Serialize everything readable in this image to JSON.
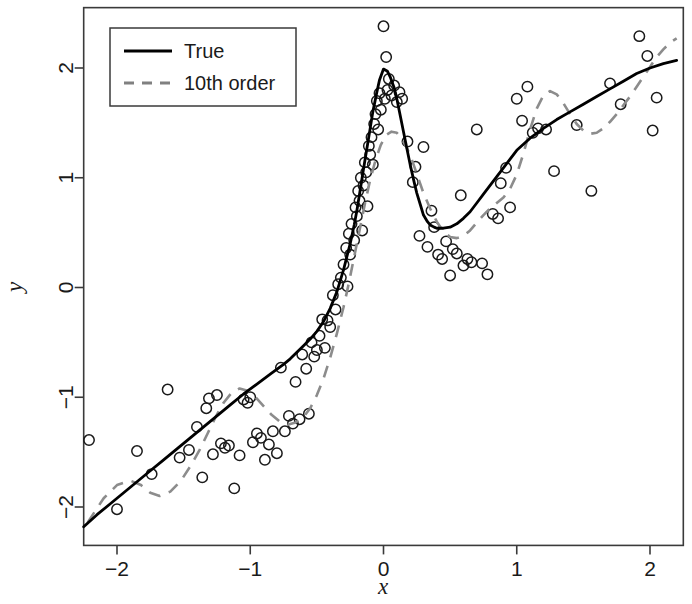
{
  "chart_data": {
    "type": "scatter",
    "title": "",
    "xlabel": "x",
    "ylabel": "y",
    "xlim": [
      -2.25,
      2.25
    ],
    "ylim": [
      -2.35,
      2.55
    ],
    "xticks": [
      -2,
      -1,
      0,
      1,
      2
    ],
    "xtick_labels": [
      "-2",
      "-1",
      "0",
      "1",
      "2"
    ],
    "yticks": [
      -2,
      -1,
      0,
      1,
      2
    ],
    "ytick_labels": [
      "-2",
      "-1",
      "0",
      "1",
      "2"
    ],
    "grid": false,
    "legend_position": "top-left",
    "legend": [
      {
        "label": "True",
        "style": "solid",
        "color": "#000000"
      },
      {
        "label": "10th order",
        "style": "dashed",
        "color": "#808080"
      }
    ],
    "series": [
      {
        "name": "True",
        "type": "line",
        "style": "solid",
        "color": "#000000",
        "points": [
          [
            -2.25,
            -2.18
          ],
          [
            -2.15,
            -2.07
          ],
          [
            -2.05,
            -1.97
          ],
          [
            -1.95,
            -1.87
          ],
          [
            -1.85,
            -1.77
          ],
          [
            -1.75,
            -1.67
          ],
          [
            -1.65,
            -1.57
          ],
          [
            -1.55,
            -1.47
          ],
          [
            -1.45,
            -1.37
          ],
          [
            -1.35,
            -1.27
          ],
          [
            -1.25,
            -1.17
          ],
          [
            -1.15,
            -1.07
          ],
          [
            -1.05,
            -0.97
          ],
          [
            -0.95,
            -0.88
          ],
          [
            -0.85,
            -0.79
          ],
          [
            -0.75,
            -0.7
          ],
          [
            -0.7,
            -0.65
          ],
          [
            -0.65,
            -0.59
          ],
          [
            -0.6,
            -0.53
          ],
          [
            -0.55,
            -0.47
          ],
          [
            -0.5,
            -0.4
          ],
          [
            -0.45,
            -0.31
          ],
          [
            -0.4,
            -0.19
          ],
          [
            -0.35,
            -0.04
          ],
          [
            -0.3,
            0.16
          ],
          [
            -0.25,
            0.4
          ],
          [
            -0.22,
            0.57
          ],
          [
            -0.2,
            0.7
          ],
          [
            -0.18,
            0.85
          ],
          [
            -0.15,
            1.08
          ],
          [
            -0.12,
            1.3
          ],
          [
            -0.1,
            1.45
          ],
          [
            -0.08,
            1.6
          ],
          [
            -0.05,
            1.78
          ],
          [
            -0.03,
            1.89
          ],
          [
            0.0,
            1.99
          ],
          [
            0.03,
            1.97
          ],
          [
            0.05,
            1.92
          ],
          [
            0.08,
            1.82
          ],
          [
            0.1,
            1.72
          ],
          [
            0.13,
            1.54
          ],
          [
            0.15,
            1.42
          ],
          [
            0.18,
            1.24
          ],
          [
            0.2,
            1.12
          ],
          [
            0.23,
            0.96
          ],
          [
            0.25,
            0.86
          ],
          [
            0.28,
            0.74
          ],
          [
            0.3,
            0.66
          ],
          [
            0.33,
            0.6
          ],
          [
            0.35,
            0.57
          ],
          [
            0.38,
            0.55
          ],
          [
            0.4,
            0.54
          ],
          [
            0.45,
            0.54
          ],
          [
            0.5,
            0.55
          ],
          [
            0.55,
            0.58
          ],
          [
            0.6,
            0.63
          ],
          [
            0.65,
            0.69
          ],
          [
            0.7,
            0.77
          ],
          [
            0.75,
            0.85
          ],
          [
            0.8,
            0.93
          ],
          [
            0.85,
            1.01
          ],
          [
            0.9,
            1.09
          ],
          [
            0.95,
            1.17
          ],
          [
            1.0,
            1.25
          ],
          [
            1.1,
            1.36
          ],
          [
            1.2,
            1.45
          ],
          [
            1.3,
            1.53
          ],
          [
            1.4,
            1.6
          ],
          [
            1.5,
            1.67
          ],
          [
            1.6,
            1.74
          ],
          [
            1.7,
            1.81
          ],
          [
            1.8,
            1.88
          ],
          [
            1.9,
            1.95
          ],
          [
            2.0,
            2.0
          ],
          [
            2.1,
            2.04
          ],
          [
            2.2,
            2.07
          ]
        ]
      },
      {
        "name": "10th order",
        "type": "line",
        "style": "dashed",
        "color": "#8c8c8c",
        "points": [
          [
            -2.22,
            -2.14
          ],
          [
            -2.1,
            -1.92
          ],
          [
            -2.0,
            -1.8
          ],
          [
            -1.9,
            -1.76
          ],
          [
            -1.82,
            -1.8
          ],
          [
            -1.75,
            -1.87
          ],
          [
            -1.68,
            -1.9
          ],
          [
            -1.6,
            -1.86
          ],
          [
            -1.52,
            -1.76
          ],
          [
            -1.45,
            -1.63
          ],
          [
            -1.38,
            -1.48
          ],
          [
            -1.32,
            -1.33
          ],
          [
            -1.26,
            -1.18
          ],
          [
            -1.2,
            -1.05
          ],
          [
            -1.14,
            -0.96
          ],
          [
            -1.08,
            -0.92
          ],
          [
            -1.02,
            -0.94
          ],
          [
            -0.96,
            -1.0
          ],
          [
            -0.9,
            -1.08
          ],
          [
            -0.84,
            -1.16
          ],
          [
            -0.78,
            -1.22
          ],
          [
            -0.72,
            -1.25
          ],
          [
            -0.66,
            -1.23
          ],
          [
            -0.6,
            -1.18
          ],
          [
            -0.55,
            -1.1
          ],
          [
            -0.5,
            -0.98
          ],
          [
            -0.45,
            -0.83
          ],
          [
            -0.4,
            -0.64
          ],
          [
            -0.35,
            -0.42
          ],
          [
            -0.3,
            -0.18
          ],
          [
            -0.26,
            0.04
          ],
          [
            -0.22,
            0.28
          ],
          [
            -0.18,
            0.52
          ],
          [
            -0.14,
            0.76
          ],
          [
            -0.1,
            0.98
          ],
          [
            -0.06,
            1.16
          ],
          [
            -0.02,
            1.3
          ],
          [
            0.02,
            1.39
          ],
          [
            0.06,
            1.42
          ],
          [
            0.1,
            1.41
          ],
          [
            0.14,
            1.35
          ],
          [
            0.18,
            1.26
          ],
          [
            0.22,
            1.14
          ],
          [
            0.26,
            1.0
          ],
          [
            0.3,
            0.86
          ],
          [
            0.35,
            0.72
          ],
          [
            0.4,
            0.6
          ],
          [
            0.45,
            0.51
          ],
          [
            0.5,
            0.46
          ],
          [
            0.55,
            0.45
          ],
          [
            0.6,
            0.47
          ],
          [
            0.65,
            0.52
          ],
          [
            0.7,
            0.59
          ],
          [
            0.75,
            0.66
          ],
          [
            0.8,
            0.72
          ],
          [
            0.85,
            0.77
          ],
          [
            0.9,
            0.82
          ],
          [
            0.95,
            0.9
          ],
          [
            1.0,
            1.03
          ],
          [
            1.05,
            1.22
          ],
          [
            1.1,
            1.44
          ],
          [
            1.15,
            1.63
          ],
          [
            1.2,
            1.75
          ],
          [
            1.25,
            1.79
          ],
          [
            1.3,
            1.76
          ],
          [
            1.35,
            1.68
          ],
          [
            1.4,
            1.58
          ],
          [
            1.45,
            1.49
          ],
          [
            1.5,
            1.43
          ],
          [
            1.55,
            1.4
          ],
          [
            1.6,
            1.41
          ],
          [
            1.65,
            1.45
          ],
          [
            1.7,
            1.51
          ],
          [
            1.75,
            1.58
          ],
          [
            1.8,
            1.66
          ],
          [
            1.85,
            1.74
          ],
          [
            1.9,
            1.83
          ],
          [
            1.95,
            1.92
          ],
          [
            2.0,
            2.01
          ],
          [
            2.05,
            2.1
          ],
          [
            2.1,
            2.17
          ],
          [
            2.15,
            2.23
          ],
          [
            2.2,
            2.27
          ]
        ]
      }
    ],
    "scatter": {
      "name": "observations",
      "marker": "open-circle",
      "color": "#1a1a1a",
      "n": 122,
      "points": [
        [
          -2.21,
          -1.39
        ],
        [
          -2.0,
          -2.02
        ],
        [
          -1.85,
          -1.49
        ],
        [
          -1.74,
          -1.7
        ],
        [
          -1.62,
          -0.93
        ],
        [
          -1.53,
          -1.55
        ],
        [
          -1.46,
          -1.48
        ],
        [
          -1.4,
          -1.27
        ],
        [
          -1.36,
          -1.73
        ],
        [
          -1.33,
          -1.1
        ],
        [
          -1.31,
          -1.01
        ],
        [
          -1.28,
          -1.52
        ],
        [
          -1.25,
          -0.98
        ],
        [
          -1.22,
          -1.42
        ],
        [
          -1.19,
          -1.46
        ],
        [
          -1.16,
          -1.44
        ],
        [
          -1.12,
          -1.83
        ],
        [
          -1.08,
          -1.53
        ],
        [
          -1.05,
          -1.02
        ],
        [
          -1.02,
          -1.05
        ],
        [
          -1.0,
          -1.0
        ],
        [
          -0.98,
          -1.41
        ],
        [
          -0.95,
          -1.33
        ],
        [
          -0.92,
          -1.37
        ],
        [
          -0.89,
          -1.57
        ],
        [
          -0.86,
          -1.43
        ],
        [
          -0.83,
          -1.31
        ],
        [
          -0.8,
          -1.51
        ],
        [
          -0.77,
          -0.73
        ],
        [
          -0.74,
          -1.31
        ],
        [
          -0.71,
          -1.17
        ],
        [
          -0.68,
          -1.24
        ],
        [
          -0.66,
          -0.86
        ],
        [
          -0.63,
          -1.2
        ],
        [
          -0.61,
          -0.61
        ],
        [
          -0.58,
          -0.74
        ],
        [
          -0.56,
          -1.15
        ],
        [
          -0.54,
          -0.5
        ],
        [
          -0.52,
          -0.63
        ],
        [
          -0.5,
          -0.57
        ],
        [
          -0.48,
          -0.44
        ],
        [
          -0.46,
          -0.29
        ],
        [
          -0.44,
          -0.55
        ],
        [
          -0.42,
          -0.3
        ],
        [
          -0.4,
          -0.36
        ],
        [
          -0.38,
          -0.07
        ],
        [
          -0.36,
          -0.2
        ],
        [
          -0.34,
          0.03
        ],
        [
          -0.32,
          0.09
        ],
        [
          -0.3,
          0.21
        ],
        [
          -0.28,
          0.36
        ],
        [
          -0.27,
          0.01
        ],
        [
          -0.26,
          0.49
        ],
        [
          -0.25,
          0.3
        ],
        [
          -0.24,
          0.58
        ],
        [
          -0.22,
          0.43
        ],
        [
          -0.21,
          0.73
        ],
        [
          -0.2,
          0.65
        ],
        [
          -0.19,
          0.88
        ],
        [
          -0.18,
          0.79
        ],
        [
          -0.17,
          1.0
        ],
        [
          -0.16,
          0.52
        ],
        [
          -0.15,
          0.93
        ],
        [
          -0.14,
          1.14
        ],
        [
          -0.13,
          1.05
        ],
        [
          -0.12,
          0.74
        ],
        [
          -0.11,
          1.29
        ],
        [
          -0.1,
          1.21
        ],
        [
          -0.09,
          1.37
        ],
        [
          -0.08,
          1.12
        ],
        [
          -0.07,
          1.49
        ],
        [
          -0.06,
          1.58
        ],
        [
          -0.05,
          1.7
        ],
        [
          -0.04,
          1.44
        ],
        [
          -0.03,
          1.77
        ],
        [
          -0.02,
          1.62
        ],
        [
          0.0,
          2.38
        ],
        [
          0.01,
          1.72
        ],
        [
          0.02,
          2.1
        ],
        [
          0.03,
          1.8
        ],
        [
          0.04,
          1.9
        ],
        [
          0.06,
          1.75
        ],
        [
          0.08,
          1.84
        ],
        [
          0.1,
          1.69
        ],
        [
          0.12,
          1.78
        ],
        [
          0.14,
          1.72
        ],
        [
          0.18,
          1.33
        ],
        [
          0.22,
          0.96
        ],
        [
          0.24,
          1.1
        ],
        [
          0.27,
          0.47
        ],
        [
          0.3,
          1.28
        ],
        [
          0.33,
          0.37
        ],
        [
          0.36,
          0.7
        ],
        [
          0.38,
          0.55
        ],
        [
          0.41,
          0.3
        ],
        [
          0.44,
          0.26
        ],
        [
          0.47,
          0.42
        ],
        [
          0.5,
          0.11
        ],
        [
          0.52,
          0.35
        ],
        [
          0.55,
          0.31
        ],
        [
          0.58,
          0.84
        ],
        [
          0.6,
          0.2
        ],
        [
          0.63,
          0.26
        ],
        [
          0.66,
          0.23
        ],
        [
          0.7,
          1.44
        ],
        [
          0.74,
          0.22
        ],
        [
          0.78,
          0.12
        ],
        [
          0.82,
          0.67
        ],
        [
          0.86,
          0.63
        ],
        [
          0.88,
          0.95
        ],
        [
          0.92,
          1.09
        ],
        [
          0.95,
          0.73
        ],
        [
          1.0,
          1.72
        ],
        [
          1.04,
          1.52
        ],
        [
          1.08,
          1.83
        ],
        [
          1.12,
          1.41
        ],
        [
          1.16,
          1.45
        ],
        [
          1.22,
          1.44
        ],
        [
          1.28,
          1.06
        ],
        [
          1.45,
          1.48
        ],
        [
          1.56,
          0.88
        ],
        [
          1.7,
          1.86
        ],
        [
          1.78,
          1.67
        ],
        [
          1.92,
          2.29
        ],
        [
          1.98,
          2.11
        ],
        [
          2.02,
          1.43
        ],
        [
          2.05,
          1.73
        ]
      ]
    }
  },
  "axis": {
    "x_title": "x",
    "y_title": "y"
  }
}
